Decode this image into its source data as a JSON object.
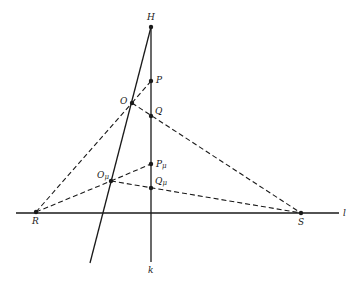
{
  "diagram": {
    "type": "projective-geometry",
    "colors": {
      "line": "#1a1a1a",
      "background": "#ffffff"
    },
    "points": [
      {
        "id": "H",
        "label": "H",
        "x": 151,
        "y": 27,
        "lx": 147,
        "ly": 20
      },
      {
        "id": "P",
        "label": "P",
        "x": 151,
        "y": 81,
        "lx": 156,
        "ly": 83
      },
      {
        "id": "O",
        "label": "O",
        "x": 132,
        "y": 103,
        "lx": 120,
        "ly": 104
      },
      {
        "id": "Q",
        "label": "Q",
        "x": 151,
        "y": 116,
        "lx": 155,
        "ly": 114
      },
      {
        "id": "Pmu",
        "label": "P",
        "sub": "μ",
        "x": 151,
        "y": 164,
        "lx": 156,
        "ly": 167
      },
      {
        "id": "Omu",
        "label": "O",
        "sub": "μ",
        "x": 111,
        "y": 181,
        "lx": 97,
        "ly": 178
      },
      {
        "id": "Qmu",
        "label": "Q",
        "sub": "μ",
        "x": 151,
        "y": 188,
        "lx": 155,
        "ly": 184
      },
      {
        "id": "R",
        "label": "R",
        "x": 36,
        "y": 212,
        "lx": 32,
        "ly": 224
      },
      {
        "id": "S",
        "label": "S",
        "x": 301,
        "y": 213,
        "lx": 298,
        "ly": 225
      }
    ],
    "lines": [
      {
        "name": "line-l",
        "label": "l",
        "x1": 16,
        "y1": 213,
        "x2": 339,
        "y2": 213,
        "dashed": false,
        "lx": 343,
        "ly": 216
      },
      {
        "name": "line-k",
        "label": "k",
        "x1": 151,
        "y1": 27,
        "x2": 151,
        "y2": 262,
        "dashed": false,
        "lx": 148,
        "ly": 273
      },
      {
        "name": "line-ho",
        "label": "",
        "x1": 151,
        "y1": 27,
        "x2": 90,
        "y2": 263,
        "dashed": false
      }
    ],
    "dashed_segments": [
      {
        "name": "seg-r-o",
        "from": "R",
        "to": "O"
      },
      {
        "name": "seg-o-p",
        "from": "O",
        "to": "P"
      },
      {
        "name": "seg-o-s",
        "from": "O",
        "to": "S"
      },
      {
        "name": "seg-r-omu",
        "from": "R",
        "to": "Omu"
      },
      {
        "name": "seg-omu-pmu",
        "from": "Omu",
        "to": "Pmu"
      },
      {
        "name": "seg-omu-s",
        "from": "Omu",
        "to": "S"
      }
    ]
  }
}
